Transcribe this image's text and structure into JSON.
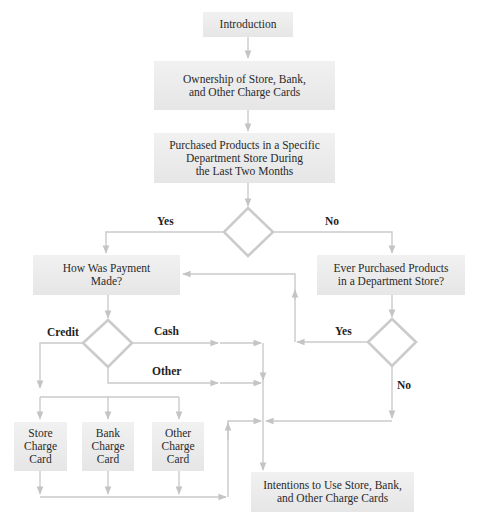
{
  "diagram": {
    "type": "flowchart",
    "line_color": "#c8c8c8",
    "box_color": "#ececec",
    "nodes": {
      "introduction": "Introduction",
      "ownership": "Ownership of Store, Bank,\nand Other Charge Cards",
      "purchased": "Purchased Products in a Specific\nDepartment Store During\nthe Last Two Months",
      "payment": "How Was Payment\nMade?",
      "ever_purchased": "Ever Purchased Products\nin a Department Store?",
      "store_card": "Store\nCharge\nCard",
      "bank_card": "Bank\nCharge\nCard",
      "other_card": "Other\nCharge\nCard",
      "intentions": "Intentions to Use Store, Bank,\nand Other Charge Cards"
    },
    "edge_labels": {
      "yes_1": "Yes",
      "no_1": "No",
      "credit": "Credit",
      "cash": "Cash",
      "other": "Other",
      "yes_2": "Yes",
      "no_2": "No"
    },
    "edges": [
      {
        "from": "introduction",
        "to": "ownership"
      },
      {
        "from": "ownership",
        "to": "purchased"
      },
      {
        "from": "purchased",
        "to": "decision_1"
      },
      {
        "from": "decision_1",
        "to": "payment",
        "label": "Yes"
      },
      {
        "from": "decision_1",
        "to": "ever_purchased",
        "label": "No"
      },
      {
        "from": "payment",
        "to": "decision_2"
      },
      {
        "from": "decision_2",
        "to": "store_card",
        "label": "Credit"
      },
      {
        "from": "decision_2",
        "to": "bank_card",
        "label": "Credit"
      },
      {
        "from": "decision_2",
        "to": "other_card",
        "label": "Credit"
      },
      {
        "from": "decision_2",
        "to": "intentions",
        "label": "Cash"
      },
      {
        "from": "decision_2",
        "to": "intentions",
        "label": "Other"
      },
      {
        "from": "ever_purchased",
        "to": "decision_3"
      },
      {
        "from": "decision_3",
        "to": "payment",
        "label": "Yes"
      },
      {
        "from": "decision_3",
        "to": "intentions",
        "label": "No"
      },
      {
        "from": "store_card",
        "to": "intentions"
      },
      {
        "from": "bank_card",
        "to": "intentions"
      },
      {
        "from": "other_card",
        "to": "intentions"
      }
    ]
  }
}
